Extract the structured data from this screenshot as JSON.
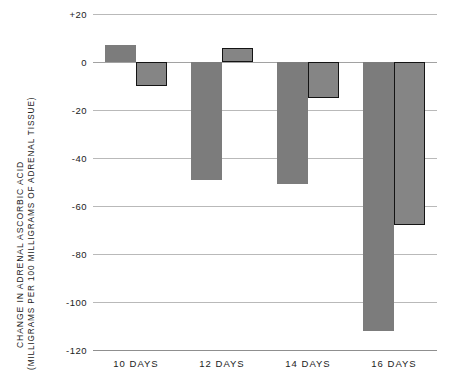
{
  "chart_data": {
    "type": "bar",
    "title": "",
    "xlabel": "",
    "ylabel": "CHANGE IN ADRENAL ASCORBIC ACID (MILLIGRAMS PER 100 MILLIGRAMS OF ADRENAL TISSUE)",
    "ylabel_line1": "CHANGE IN ADRENAL ASCORBIC ACID",
    "ylabel_line2": "(MILLIGRAMS PER 100 MILLIGRAMS OF ADRENAL TISSUE)",
    "categories": [
      "10 DAYS",
      "12 DAYS",
      "14 DAYS",
      "16 DAYS"
    ],
    "ylim": [
      -120,
      20
    ],
    "yticks": [
      20,
      0,
      -20,
      -40,
      -60,
      -80,
      -100,
      -120
    ],
    "ytick_labels": [
      "+20",
      "0",
      "-20",
      "-40",
      "-60",
      "-80",
      "-100",
      "-120"
    ],
    "grid": true,
    "legend": "none",
    "series": [
      {
        "name": "first-bar",
        "style": "filled",
        "values": [
          7,
          -49,
          -51,
          -112
        ]
      },
      {
        "name": "second-bar",
        "style": "outlined",
        "values": [
          -10,
          6,
          -15,
          -68
        ]
      }
    ],
    "colors": {
      "fill": "#7c7c7c",
      "outline_fill": "#858585",
      "outline_stroke": "#141414",
      "gridline": "#b9b9b9",
      "text": "#222222"
    }
  }
}
